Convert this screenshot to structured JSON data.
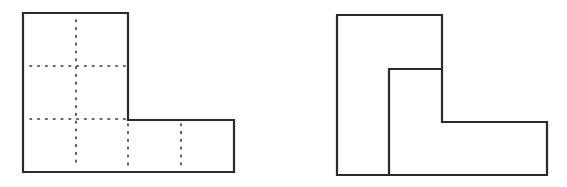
{
  "figure": {
    "stroke_color": "#2a2a2a",
    "dot_color": "#333333",
    "background": "#ffffff",
    "left_shape": {
      "description": "L-shaped figure divided by dotted lines into 6 unit squares",
      "outline": [
        [
          23,
          13
        ],
        [
          128,
          13
        ],
        [
          128,
          120
        ],
        [
          234,
          120
        ],
        [
          234,
          172
        ],
        [
          23,
          172
        ]
      ],
      "dotted_lines": [
        {
          "x1": 76,
          "y1": 20,
          "x2": 76,
          "y2": 166
        },
        {
          "x1": 30,
          "y1": 66,
          "x2": 126,
          "y2": 66
        },
        {
          "x1": 30,
          "y1": 119,
          "x2": 126,
          "y2": 119
        },
        {
          "x1": 128,
          "y1": 124,
          "x2": 128,
          "y2": 166
        },
        {
          "x1": 181,
          "y1": 124,
          "x2": 181,
          "y2": 166
        }
      ]
    },
    "right_shape": {
      "description": "Same L-shape divided into two congruent L-shaped pieces",
      "outline": [
        [
          337,
          15
        ],
        [
          442,
          15
        ],
        [
          442,
          122
        ],
        [
          547,
          122
        ],
        [
          547,
          175
        ],
        [
          337,
          175
        ]
      ],
      "divider": [
        [
          389,
          175
        ],
        [
          389,
          69
        ],
        [
          442,
          69
        ]
      ]
    }
  }
}
